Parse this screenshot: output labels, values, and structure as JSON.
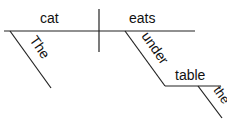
{
  "diagram": {
    "type": "sentence-diagram",
    "subject": "cat",
    "verb": "eats",
    "subject_modifier": "The",
    "preposition": "under",
    "prep_object": "table",
    "object_modifier": "the"
  }
}
